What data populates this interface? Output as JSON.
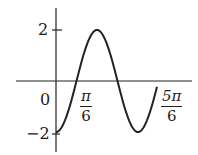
{
  "chart_data": {
    "type": "line",
    "title": "",
    "xlabel": "",
    "ylabel": "",
    "function_description": "sinusoid with amplitude 2, starting at minimum -2 at x=0",
    "x_tick_labels": [
      {
        "value": 0,
        "label": "0"
      },
      {
        "value": 0.5236,
        "num": "π",
        "den": "6"
      },
      {
        "value": 2.618,
        "num": "5π",
        "den": "6"
      }
    ],
    "y_tick_labels": [
      {
        "value": 2,
        "label": "2"
      },
      {
        "value": -2,
        "label": "−2"
      }
    ],
    "ylim": [
      -2,
      2
    ],
    "grid": false,
    "legend": null,
    "series": [
      {
        "name": "curve",
        "x": [
          0,
          0.2618,
          0.5236,
          0.7854,
          1.0472,
          1.309,
          1.5708,
          1.8326,
          2.0944,
          2.3562,
          2.618
        ],
        "y": [
          -2,
          -1.41,
          0,
          1.41,
          2,
          1.41,
          0,
          -1.41,
          -2,
          -1.41,
          0.2
        ]
      }
    ]
  },
  "labels": {
    "origin": "0",
    "y_top": "2",
    "y_bottom": "−2",
    "x_pi6_num": "π",
    "x_pi6_den": "6",
    "x_5pi6_num": "5π",
    "x_5pi6_den": "6"
  }
}
